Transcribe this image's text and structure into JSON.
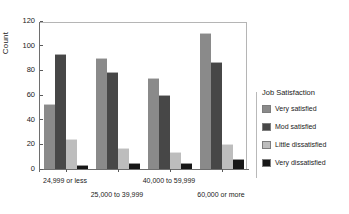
{
  "chart_data": {
    "type": "bar",
    "title": "",
    "subtitle": "",
    "xlabel": "",
    "ylabel": "Count",
    "ylim": [
      0,
      120
    ],
    "yticks": [
      0,
      20,
      40,
      60,
      80,
      100,
      120
    ],
    "grid": false,
    "legend_position": "right",
    "legend_title": "Job Satisfaction",
    "categories": [
      "24,999 or less",
      "25,000 to 39,999",
      "40,000 to 59,999",
      "60,000 or more"
    ],
    "series": [
      {
        "name": "Very satisfied",
        "color": "#8a8a8a",
        "values": [
          53,
          90,
          74,
          110
        ]
      },
      {
        "name": "Mod satisfied",
        "color": "#474747",
        "values": [
          93,
          79,
          60,
          87
        ]
      },
      {
        "name": "Little dissatisfied",
        "color": "#bdbdbd",
        "values": [
          24,
          17,
          14,
          20
        ]
      },
      {
        "name": "Very dissatisfied",
        "color": "#171717",
        "values": [
          3,
          5,
          5,
          8
        ]
      }
    ]
  },
  "axes": {
    "y_title": "Count",
    "y_tick_labels": [
      "0",
      "20",
      "40",
      "60",
      "80",
      "100",
      "120"
    ]
  },
  "legend": {
    "title": "Job Satisfaction",
    "items": [
      {
        "label": "Very satisfied"
      },
      {
        "label": "Mod satisfied"
      },
      {
        "label": "Little dissatisfied"
      },
      {
        "label": "Very dissatisfied"
      }
    ]
  }
}
